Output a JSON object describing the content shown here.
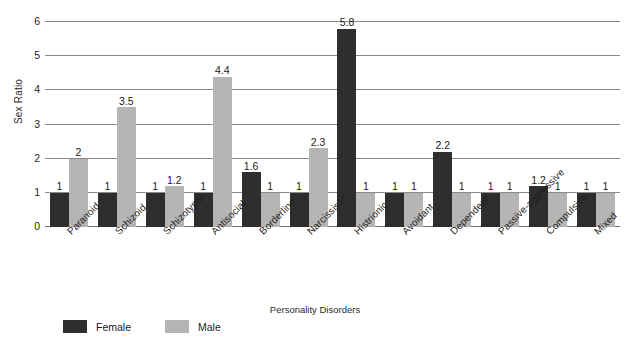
{
  "chart_data": {
    "type": "bar",
    "title": "",
    "xlabel": "Personality Disorders",
    "ylabel": "Sex Ratio",
    "ylim": [
      0,
      6
    ],
    "yticks": [
      0,
      1,
      2,
      3,
      4,
      5,
      6
    ],
    "grid": true,
    "legend_position": "bottom-left",
    "categories": [
      "Paranoid",
      "Schizoid",
      "Schizotypal",
      "Antisocial",
      "Borderline",
      "Narcissistic",
      "Histrionic",
      "Avoidant",
      "Dependent",
      "Passive-aggressive",
      "Compulsive",
      "Mixed"
    ],
    "series": [
      {
        "name": "Female",
        "color": "#2e2e2e",
        "values": [
          1,
          1,
          1,
          1,
          1.6,
          1,
          5.8,
          1,
          2.2,
          1,
          1.2,
          1
        ],
        "labels": [
          "1",
          "1",
          "1",
          "1",
          "1.6",
          "1",
          "5.8",
          "1",
          "2.2",
          "1",
          "1.2",
          "1"
        ]
      },
      {
        "name": "Male",
        "color": "#b5b5b5",
        "values": [
          2,
          3.5,
          1.2,
          4.4,
          1,
          2.3,
          1,
          1,
          1,
          1,
          1,
          1
        ],
        "labels": [
          "2",
          "3.5",
          "1.2",
          "4.4",
          "1",
          "2.3",
          "1",
          "1",
          "1",
          "1",
          "1",
          "1"
        ]
      }
    ]
  },
  "legend": {
    "items": [
      {
        "label": "Female",
        "swatch": "female"
      },
      {
        "label": "Male",
        "swatch": "male"
      }
    ]
  }
}
